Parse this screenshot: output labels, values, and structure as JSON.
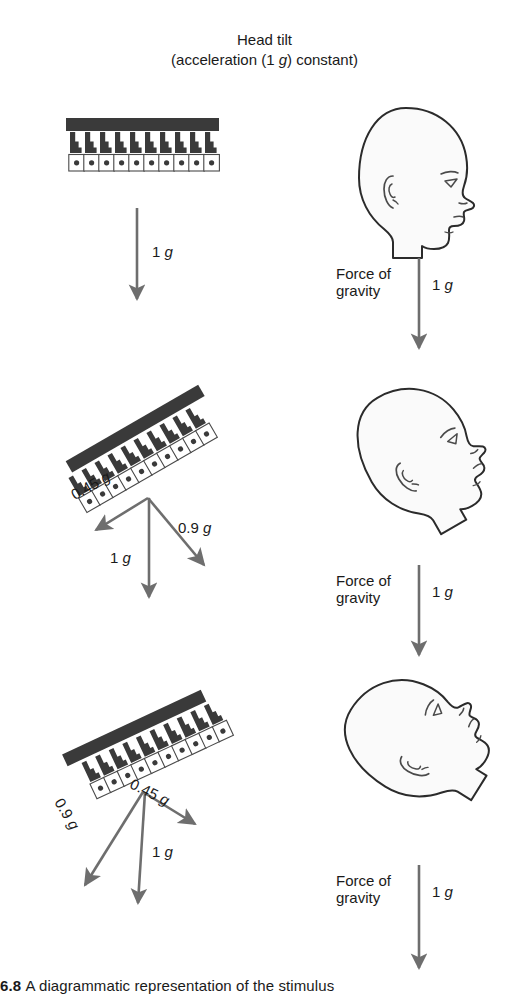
{
  "title": {
    "line1": "Head tilt",
    "line2_pre": "(acceleration (1 ",
    "line2_ital": "g",
    "line2_post": ") constant)"
  },
  "colors": {
    "membrane": "#3a3a3a",
    "hair_bundle": "#3a3a3a",
    "cell_body_fill": "#ffffff",
    "cell_outline": "#4a4a4a",
    "nucleus": "#3a3a3a",
    "arrow": "#6e6e6e",
    "head_outline": "#2b2b2b",
    "head_fill": "#fafafa",
    "text": "#1a1a1a"
  },
  "panels": [
    {
      "id": "upright",
      "macula": {
        "tilt_deg": 0,
        "cell_count": 10,
        "shear_px": 0,
        "label": "otolith-macula-upright"
      },
      "head": {
        "tilt_deg": 0,
        "label": "head-upright"
      },
      "left_vectors": [
        {
          "name": "gravity",
          "magnitude": "1",
          "unit": "g",
          "label": "1 g",
          "angle_deg": 90
        }
      ],
      "right_vector": {
        "force_label": "Force of\ngravity",
        "magnitude": "1",
        "unit": "g",
        "label": "1 g"
      }
    },
    {
      "id": "tilted-back",
      "macula": {
        "tilt_deg": -30,
        "cell_count": 10,
        "shear_px": 9,
        "label": "otolith-macula-tilted-back"
      },
      "head": {
        "tilt_deg": -30,
        "label": "head-tilted-back"
      },
      "left_vectors": [
        {
          "name": "shear",
          "magnitude": "0.45",
          "unit": "g",
          "label": "0.45 g",
          "angle_deg": 210
        },
        {
          "name": "normal",
          "magnitude": "0.9",
          "unit": "g",
          "label": "0.9 g",
          "angle_deg": 60
        },
        {
          "name": "gravity",
          "magnitude": "1",
          "unit": "g",
          "label": "1 g",
          "angle_deg": 90
        }
      ],
      "right_vector": {
        "force_label": "Force of\ngravity",
        "magnitude": "1",
        "unit": "g",
        "label": "1 g"
      }
    },
    {
      "id": "tilted-forward",
      "macula": {
        "tilt_deg": 25,
        "cell_count": 10,
        "shear_px": -9,
        "label": "otolith-macula-tilted-forward"
      },
      "head": {
        "tilt_deg": 38,
        "label": "head-tilted-forward"
      },
      "left_vectors": [
        {
          "name": "shear",
          "magnitude": "0.45",
          "unit": "g",
          "label": "0.45 g",
          "angle_deg": 25
        },
        {
          "name": "normal",
          "magnitude": "0.9",
          "unit": "g",
          "label": "0.9 g",
          "angle_deg": 115
        },
        {
          "name": "gravity",
          "magnitude": "1",
          "unit": "g",
          "label": "1 g",
          "angle_deg": 90
        }
      ],
      "right_vector": {
        "force_label": "Force of\ngravity",
        "magnitude": "1",
        "unit": "g",
        "label": "1 g"
      }
    }
  ],
  "labels": {
    "p1_g": "1 g",
    "p2_shear": "0.45 g",
    "p2_normal": "0.9 g",
    "p2_g": "1 g",
    "p3_shear": "0.45 g",
    "p3_normal": "0.9 g",
    "p3_g": "1 g",
    "force_of_gravity": "Force of\ngravity",
    "fog_g": "1 g"
  },
  "caption": {
    "figure_number": "6.8",
    "text": "A diagrammatic representation of the stimulus"
  }
}
